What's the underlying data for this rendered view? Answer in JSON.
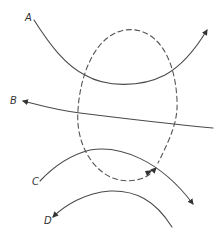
{
  "diagram": {
    "labels": {
      "a": "A",
      "b": "B",
      "c": "C",
      "d": "D"
    },
    "elements": [
      {
        "id": "curve-a",
        "label": "A",
        "style": "solid",
        "arrow": "end",
        "direction": "left-to-right, concave up"
      },
      {
        "id": "curve-b",
        "label": "B",
        "style": "solid",
        "arrow": "start",
        "direction": "right-to-left, nearly straight"
      },
      {
        "id": "curve-c",
        "label": "C",
        "style": "solid",
        "arrow": "end",
        "direction": "left-to-right, concave down"
      },
      {
        "id": "curve-d",
        "label": "D",
        "style": "solid",
        "arrow": "start",
        "direction": "right-to-left, concave down"
      },
      {
        "id": "dashed-loop",
        "label": "",
        "style": "dashed",
        "arrow": "end",
        "direction": "oval loop, clockwise ending bottom-right"
      }
    ],
    "colors": {
      "stroke": "#4a4a4a",
      "background": "#ffffff"
    }
  }
}
